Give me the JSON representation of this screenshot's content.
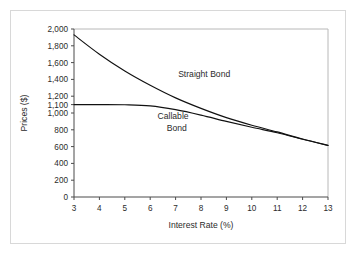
{
  "chart_data": {
    "type": "line",
    "title": "",
    "xlabel": "Interest Rate (%)",
    "ylabel": "Prices ($)",
    "xlim": [
      3,
      13
    ],
    "ylim": [
      0,
      2000
    ],
    "grid": false,
    "legend_position": "inline-annotations",
    "xticks": [
      3,
      4,
      5,
      6,
      7,
      8,
      9,
      10,
      11,
      12,
      13
    ],
    "xtick_labels": [
      "3",
      "4",
      "5",
      "6",
      "7",
      "8",
      "9",
      "10",
      "11",
      "12",
      "13"
    ],
    "yticks": [
      0,
      200,
      400,
      600,
      800,
      1000,
      1100,
      1200,
      1400,
      1600,
      1800,
      2000
    ],
    "ytick_labels": [
      "0",
      "200",
      "400",
      "600",
      "800",
      "1,000",
      "1,100",
      "1,200",
      "1,400",
      "1,600",
      "1,800",
      "2,000"
    ],
    "x": [
      3,
      4,
      5,
      6,
      7,
      8,
      9,
      10,
      11,
      12,
      13
    ],
    "series": [
      {
        "name": "Straight Bond",
        "values": [
          1930,
          1700,
          1500,
          1330,
          1180,
          1055,
          945,
          855,
          775,
          690,
          615
        ],
        "style": "solid",
        "color": "#111111",
        "annotation": "Straight Bond",
        "annotation_x": 7.1,
        "annotation_y": 1430
      },
      {
        "name": "Callable Bond",
        "values": [
          1100,
          1100,
          1098,
          1085,
          1040,
          975,
          900,
          830,
          765,
          688,
          613
        ],
        "style": "solid",
        "color": "#111111",
        "annotation": "Callable Bond",
        "annotation_x": 7.0,
        "annotation_y": 880
      }
    ],
    "annotations": [
      {
        "text": "Straight Bond",
        "x": 7.1,
        "y": 1430
      },
      {
        "text": "Callable",
        "x": 6.9,
        "y": 930
      },
      {
        "text": "Bond",
        "x": 7.05,
        "y": 790
      }
    ]
  },
  "labels": {
    "straight_bond": "Straight Bond",
    "callable_bond_line1": "Callable",
    "callable_bond_line2": "Bond"
  },
  "colors": {
    "line": "#111111",
    "axis": "#4a4a4a",
    "frame_border": "#d8d8d8",
    "plot_border": "#b8b8b8",
    "background": "#ffffff",
    "text": "#2b2b2b"
  }
}
